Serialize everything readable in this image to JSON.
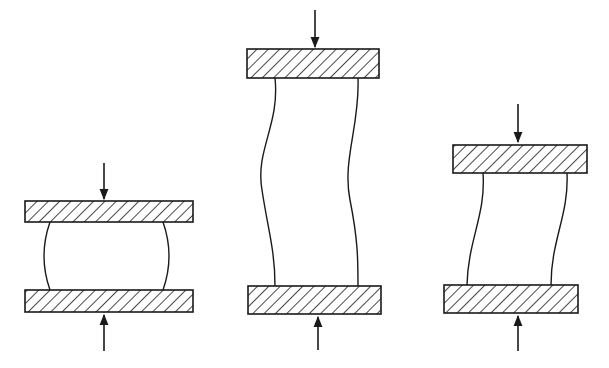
{
  "diagram": {
    "stroke_color": "#1a1a1a",
    "background": "#ffffff",
    "specimens": [
      {
        "id": "barreling",
        "description": "Short specimen - barreling",
        "top_plate": {
          "x": 25,
          "y": 201,
          "w": 168,
          "h": 21
        },
        "bottom_plate": {
          "x": 25,
          "y": 290,
          "w": 168,
          "h": 22
        },
        "top_arrow": {
          "x": 104,
          "y1": 163,
          "y2": 199
        },
        "bottom_arrow": {
          "x": 104,
          "y1": 351,
          "y2": 315
        },
        "left_side": "M50,222 Q38,256 50,290",
        "right_side": "M163,222 Q175,256 163,290"
      },
      {
        "id": "double-buckling",
        "description": "Long specimen - S-shaped buckling",
        "top_plate": {
          "x": 247,
          "y": 49,
          "w": 132,
          "h": 29
        },
        "bottom_plate": {
          "x": 248,
          "y": 286,
          "w": 133,
          "h": 28
        },
        "top_arrow": {
          "x": 315,
          "y1": 10,
          "y2": 47
        },
        "bottom_arrow": {
          "x": 318,
          "y1": 350,
          "y2": 317
        },
        "left_side": "M275,78 C280,125 255,150 262,190 C268,230 275,250 275,286",
        "right_side": "M358,78 C360,125 342,160 350,200 C358,240 358,260 358,286"
      },
      {
        "id": "shearing",
        "description": "Medium specimen - shear/lateral offset",
        "top_plate": {
          "x": 453,
          "y": 145,
          "w": 134,
          "h": 28
        },
        "bottom_plate": {
          "x": 444,
          "y": 285,
          "w": 134,
          "h": 28
        },
        "top_arrow": {
          "x": 518,
          "y1": 104,
          "y2": 142
        },
        "bottom_arrow": {
          "x": 518,
          "y1": 351,
          "y2": 316
        },
        "left_side": "M483,173 C486,215 468,240 467,285",
        "right_side": "M567,173 C569,215 551,240 551,285"
      }
    ]
  }
}
